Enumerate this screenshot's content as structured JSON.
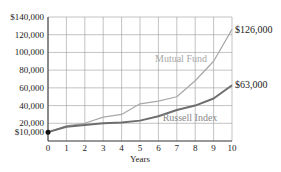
{
  "chart_data": {
    "type": "line",
    "title": "",
    "xlabel": "Years",
    "ylabel": "",
    "x": [
      0,
      1,
      2,
      3,
      4,
      5,
      6,
      7,
      8,
      9,
      10
    ],
    "xlim": [
      0,
      10
    ],
    "ylim": [
      0,
      140000
    ],
    "x_ticks": [
      "0",
      "1",
      "2",
      "3",
      "4",
      "5",
      "6",
      "7",
      "8",
      "9",
      "10"
    ],
    "y_ticks": [
      {
        "value": 140000,
        "label": "$140,000"
      },
      {
        "value": 120000,
        "label": "120,000"
      },
      {
        "value": 100000,
        "label": "100,000"
      },
      {
        "value": 80000,
        "label": "80,000"
      },
      {
        "value": 60000,
        "label": "60,000"
      },
      {
        "value": 40000,
        "label": "40,000"
      },
      {
        "value": 20000,
        "label": "20,000"
      },
      {
        "value": 10000,
        "label": "$10,000"
      }
    ],
    "grid": true,
    "series": [
      {
        "name": "Mutual Fund",
        "color": "#a8a8a8",
        "values": [
          10000,
          17000,
          20000,
          27000,
          30000,
          42000,
          45000,
          50000,
          68000,
          90000,
          126000
        ],
        "end_label": "$126,000"
      },
      {
        "name": "Russell Index",
        "color": "#6e6e6e",
        "values": [
          10000,
          16000,
          18000,
          20000,
          21000,
          23000,
          28000,
          35000,
          40000,
          48000,
          63000
        ],
        "end_label": "$63,000"
      }
    ],
    "start_point": {
      "x": 0,
      "y": 10000
    }
  },
  "labels": {
    "xlabel": "Years",
    "mutual_fund": "Mutual Fund",
    "russell": "Russell Index",
    "mf_end": "$126,000",
    "ri_end": "$63,000"
  }
}
